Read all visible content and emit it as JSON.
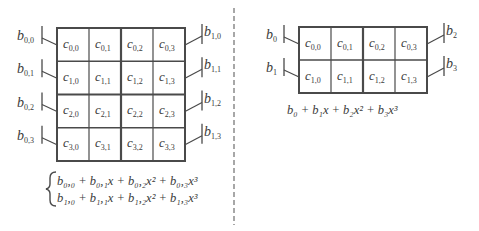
{
  "left_panel": {
    "grid": {
      "rows": 4,
      "cols": 4,
      "cells": [
        [
          "c_{0,0}",
          "c_{0,1}",
          "c_{0,2}",
          "c_{0,3}"
        ],
        [
          "c_{1,0}",
          "c_{1,1}",
          "c_{1,2}",
          "c_{1,3}"
        ],
        [
          "c_{2,0}",
          "c_{2,1}",
          "c_{2,2}",
          "c_{2,3}"
        ],
        [
          "c_{3,0}",
          "c_{3,1}",
          "c_{3,2}",
          "c_{3,3}"
        ]
      ]
    },
    "left_labels": [
      {
        "base": "b",
        "sub": "0,0"
      },
      {
        "base": "b",
        "sub": "0,1"
      },
      {
        "base": "b",
        "sub": "0,2"
      },
      {
        "base": "b",
        "sub": "0,3"
      }
    ],
    "right_labels": [
      {
        "base": "b",
        "sub": "1,0"
      },
      {
        "base": "b",
        "sub": "1,1"
      },
      {
        "base": "b",
        "sub": "1,2"
      },
      {
        "base": "b",
        "sub": "1,3"
      }
    ],
    "formula_lines": [
      "b₀,₀ + b₀,₁x + b₀,₂x² + b₀,₃x³",
      "b₁,₀ + b₁,₁x + b₁,₂x² + b₁,₃x³"
    ]
  },
  "right_panel": {
    "grid": {
      "rows": 2,
      "cols": 4,
      "cells": [
        [
          "c_{0,0}",
          "c_{0,1}",
          "c_{0,2}",
          "c_{0,3}"
        ],
        [
          "c_{1,0}",
          "c_{1,1}",
          "c_{1,2}",
          "c_{1,3}"
        ]
      ]
    },
    "left_labels": [
      {
        "base": "b",
        "sub": "0"
      },
      {
        "base": "b",
        "sub": "1"
      }
    ],
    "right_labels": [
      {
        "base": "b",
        "sub": "2"
      },
      {
        "base": "b",
        "sub": "3"
      }
    ],
    "formula": "b₀ + b₁x + b₂x² + b₃x³"
  },
  "colors": {
    "line": "#4a4a4a",
    "text": "#3a3a3a",
    "divider": "#8a8a8a"
  }
}
